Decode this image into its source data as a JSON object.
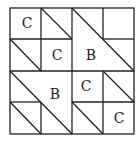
{
  "figure": {
    "grid": {
      "rows": 4,
      "cols": 4,
      "x0": 10,
      "y0": 8,
      "cell": 31
    },
    "labels": [
      {
        "text": "C",
        "row": 0,
        "col": 0
      },
      {
        "text": "C",
        "row": 1,
        "col": 1
      },
      {
        "text": "B",
        "row": 1,
        "col": 2
      },
      {
        "text": "B",
        "row": 2,
        "col": 1
      },
      {
        "text": "C",
        "row": 2,
        "col": 2
      },
      {
        "text": "C",
        "row": 3,
        "col": 3
      }
    ],
    "line_color": "#222222"
  }
}
